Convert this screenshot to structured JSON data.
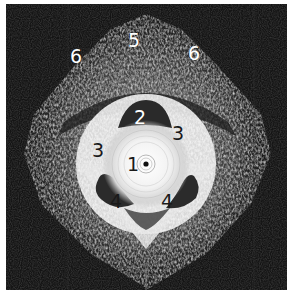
{
  "image": {
    "type": "endoanal ultrasound cross-section",
    "background_color": "#121212",
    "labels": [
      {
        "text": "5",
        "x": 134,
        "y": 40,
        "tone": "light"
      },
      {
        "text": "6",
        "x": 76,
        "y": 56,
        "tone": "light"
      },
      {
        "text": "6",
        "x": 194,
        "y": 53,
        "tone": "light"
      },
      {
        "text": "2",
        "x": 140,
        "y": 117,
        "tone": "light"
      },
      {
        "text": "3",
        "x": 98,
        "y": 150,
        "tone": "dark"
      },
      {
        "text": "3",
        "x": 178,
        "y": 133,
        "tone": "dark"
      },
      {
        "text": "1",
        "x": 133,
        "y": 164,
        "tone": "dark"
      },
      {
        "text": "4",
        "x": 116,
        "y": 201,
        "tone": "dark"
      },
      {
        "text": "4",
        "x": 167,
        "y": 201,
        "tone": "dark"
      }
    ],
    "probe_center": {
      "x": 146,
      "y": 164
    }
  }
}
